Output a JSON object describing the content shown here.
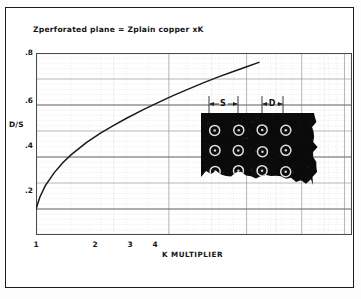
{
  "figure": {
    "title": "Zperforated plane  =  Zplain copper xK",
    "border_color": "#1c1c1c"
  },
  "axes": {
    "ylabel": "D/S",
    "xlabel": "K MULTIPLIER",
    "yticks": [
      ".8",
      ".6",
      ".4",
      ".2"
    ],
    "xticks": [
      "1",
      "2",
      "3",
      "4"
    ]
  },
  "annotations": {
    "spacing_label": "S",
    "diameter_label": "D"
  },
  "photo": {
    "name": "perforated-copper-plane-photo",
    "rows": 3,
    "cols": 4,
    "background": "#0a0a0a",
    "hole_ring": "#f2f2f2"
  },
  "chart_data": {
    "type": "line",
    "title": "Zperforated plane  =  Zplain copper xK",
    "xlabel": "K MULTIPLIER",
    "ylabel": "D/S",
    "xscale": "log",
    "yscale": "linear",
    "xlim": [
      1.0,
      5.2
    ],
    "ylim": [
      0.1,
      0.8
    ],
    "xticks": [
      1,
      2,
      3,
      4
    ],
    "yticks": [
      0.2,
      0.4,
      0.6,
      0.8
    ],
    "grid": true,
    "legend": null,
    "series": [
      {
        "name": "D/S vs K",
        "x": [
          1.0,
          1.02,
          1.05,
          1.1,
          1.15,
          1.2,
          1.3,
          1.4,
          1.5,
          1.6,
          1.75,
          1.9,
          2.05,
          2.2,
          2.4,
          2.6,
          2.8,
          3.0,
          3.2
        ],
        "y": [
          0.2,
          0.245,
          0.29,
          0.34,
          0.378,
          0.408,
          0.455,
          0.492,
          0.522,
          0.548,
          0.582,
          0.611,
          0.637,
          0.659,
          0.686,
          0.709,
          0.729,
          0.747,
          0.764
        ]
      }
    ],
    "curve_start": {
      "x": 1.0,
      "y": 0.2
    },
    "curve_end": {
      "x": 3.2,
      "y": 0.8
    }
  }
}
